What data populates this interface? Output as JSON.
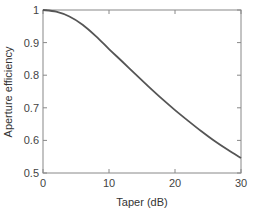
{
  "chart_data": {
    "type": "line",
    "title": "",
    "xlabel": "Taper (dB)",
    "ylabel": "Aperture efficiency",
    "xlim": [
      0,
      30
    ],
    "ylim": [
      0.5,
      1
    ],
    "xticks": [
      0,
      10,
      20,
      30
    ],
    "xtick_labels": [
      "0",
      "10",
      "20",
      "30"
    ],
    "yticks": [
      0.5,
      0.6,
      0.7,
      0.8,
      0.9,
      1.0
    ],
    "ytick_labels": [
      "0.5",
      "0.6",
      "0.7",
      "0.8",
      "0.9",
      "1"
    ],
    "grid": false,
    "legend": null,
    "series": [
      {
        "name": "Aperture efficiency",
        "color": "#555555",
        "x": [
          0,
          2,
          4,
          6,
          8,
          10,
          12,
          14,
          16,
          18,
          20,
          22,
          24,
          26,
          28,
          30
        ],
        "y": [
          1.0,
          0.995,
          0.98,
          0.955,
          0.92,
          0.88,
          0.842,
          0.803,
          0.765,
          0.728,
          0.693,
          0.66,
          0.628,
          0.598,
          0.571,
          0.546
        ]
      }
    ]
  }
}
